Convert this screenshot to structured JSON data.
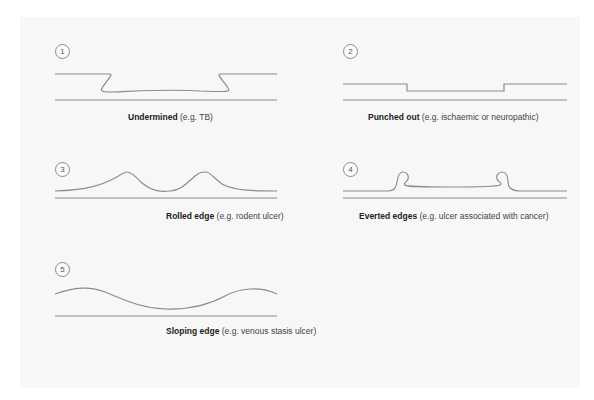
{
  "figure": {
    "background_color": "#f7f7f7",
    "line_color": "#8c8c8c",
    "diagrams": [
      {
        "number": "1",
        "title": "Undermined",
        "example": "(e.g. TB)",
        "shape": "undermined"
      },
      {
        "number": "2",
        "title": "Punched out",
        "example": "(e.g. ischaemic or neuropathic)",
        "shape": "punched-out"
      },
      {
        "number": "3",
        "title": "Rolled edge",
        "example": "(e.g. rodent ulcer)",
        "shape": "rolled"
      },
      {
        "number": "4",
        "title": "Everted edges",
        "example": "(e.g. ulcer associated with cancer)",
        "shape": "everted"
      },
      {
        "number": "5",
        "title": "Sloping edge",
        "example": "(e.g. venous stasis ulcer)",
        "shape": "sloping"
      }
    ]
  }
}
